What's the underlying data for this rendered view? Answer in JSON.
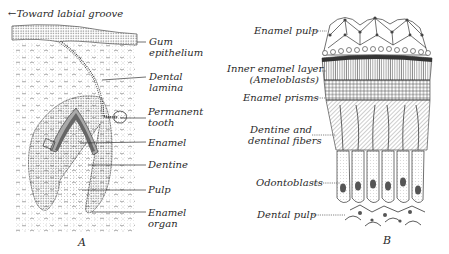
{
  "figure_a": {
    "letter": "A",
    "direction_label": "←Toward labial groove",
    "labels": {
      "gum_epithelium_1": "Gum",
      "gum_epithelium_2": "epithelium",
      "dental_lamina_1": "Dental",
      "dental_lamina_2": "lamina",
      "permanent_tooth_1": "Permanent",
      "permanent_tooth_2": "tooth",
      "enamel": "Enamel",
      "dentine": "Dentine",
      "pulp": "Pulp",
      "enamel_organ_1": "Enamel",
      "enamel_organ_2": "organ"
    }
  },
  "figure_b": {
    "letter": "B",
    "labels": {
      "enamel_pulp": "Enamel pulp",
      "inner_enamel_layer_1": "Inner enamel layer",
      "inner_enamel_layer_2": "(Ameloblasts)",
      "enamel_prisms": "Enamel prisms",
      "dentine_fibers_1": "Dentine and",
      "dentine_fibers_2": "dentinal fibers",
      "odontoblasts": "Odontoblasts",
      "dental_pulp": "Dental pulp"
    }
  },
  "colors": {
    "ink": "#2a2a2a",
    "paper": "#ffffff"
  }
}
